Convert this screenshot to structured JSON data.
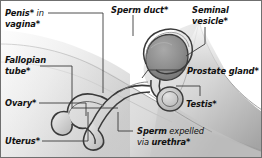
{
  "figure": {
    "background_color": "#ffffff",
    "border_color": "#6f6f6f",
    "ink_color": "#111111",
    "leader_line_color": "#3a3a3a"
  },
  "labels": {
    "penis_in_vagina": {
      "bold1": "Penis*",
      "regular": " in",
      "bold2": "vagina*"
    },
    "fallopian_tube": {
      "line1": "Fallopian",
      "line2": "tube*"
    },
    "ovary": {
      "text": "Ovary*"
    },
    "uterus": {
      "text": "Uterus*"
    },
    "sperm_duct": {
      "text": "Sperm duct*"
    },
    "seminal_vesicle": {
      "line1": "Seminal",
      "line2": "vesicle*"
    },
    "prostate_gland": {
      "text": "Prostate gland*"
    },
    "testis": {
      "text": "Testis*"
    },
    "sperm_expelled": {
      "bold1": "Sperm",
      "regular1": " expelled",
      "regular2": "via ",
      "bold2": "urethra*"
    }
  },
  "parts": [
    "Penis* in vagina*",
    "Fallopian tube*",
    "Ovary*",
    "Uterus*",
    "Sperm duct*",
    "Seminal vesicle*",
    "Prostate gland*",
    "Testis*",
    "Sperm expelled via urethra*"
  ]
}
